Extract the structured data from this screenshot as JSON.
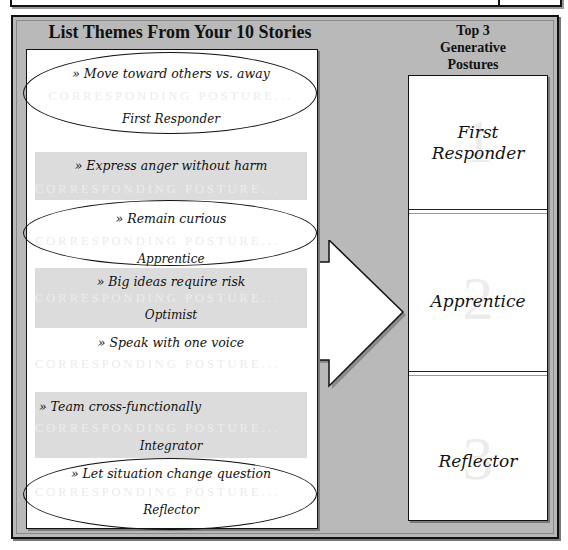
{
  "header": {
    "left_title": "List Themes From Your 10 Stories",
    "right_title_lines": [
      "Top 3",
      "Generative",
      "Postures"
    ]
  },
  "themes": [
    {
      "theme": "» Move toward others vs. away",
      "ghost": "CORRESPONDING POSTURE...",
      "posture": "First Responder",
      "circled": true,
      "shaded": false
    },
    {
      "theme": "» Express anger without harm",
      "ghost": "CORRESPONDING POSTURE...",
      "posture": "",
      "circled": false,
      "shaded": true
    },
    {
      "theme": "» Remain curious",
      "ghost": "CORRESPONDING POSTURE...",
      "posture": "Apprentice",
      "circled": true,
      "shaded": false
    },
    {
      "theme": "» Big ideas require risk",
      "ghost": "CORRESPONDING POSTURE...",
      "posture": "Optimist",
      "circled": false,
      "shaded": true
    },
    {
      "theme": "» Speak with one voice",
      "ghost": "CORRESPONDING POSTURE...",
      "posture": "",
      "circled": false,
      "shaded": false
    },
    {
      "theme": "» Team cross-functionally",
      "ghost": "CORRESPONDING POSTURE...",
      "posture": "Integrator",
      "circled": false,
      "shaded": true
    },
    {
      "theme": "» Let situation change question",
      "ghost": "CORRESPONDING POSTURE...",
      "posture": "Reflector",
      "circled": true,
      "shaded": false
    }
  ],
  "top3": [
    {
      "rank": "1",
      "name": "First Responder",
      "name_lines": [
        "First",
        "Responder"
      ]
    },
    {
      "rank": "2",
      "name": "Apprentice",
      "name_lines": [
        "Apprentice"
      ]
    },
    {
      "rank": "3",
      "name": "Reflector",
      "name_lines": [
        "Reflector"
      ]
    }
  ],
  "colors": {
    "panel_bg": "#b9b9b9",
    "box_bg": "#ffffff",
    "shade_bg": "#dcdcdc",
    "ink": "#111111",
    "ghost_text": "#ececec"
  }
}
